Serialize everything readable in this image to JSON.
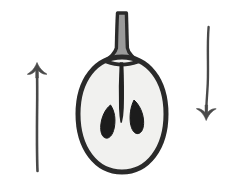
{
  "figure": {
    "background_color": "#ffffff",
    "width": 235,
    "height": 195,
    "style": "hand-drawn ink illustration",
    "alt_text": "A halved apple-like fruit shown in cross-section between an upward arrow on the left and a downward arrow on the right."
  },
  "palette": {
    "ink": "#2b2b2b",
    "ink_soft": "#4a4a4a",
    "flesh": "#f1f1ef",
    "stem_fill": "#9a9a9a",
    "seed": "#1c1c1c",
    "core": "#232323",
    "background": "#ffffff"
  },
  "elements": {
    "left_arrow": {
      "name": "up-arrow",
      "direction": "up",
      "label": "",
      "color": "#4a4a4a",
      "tail_x": 37,
      "tail_y": 172,
      "head_x": 37,
      "head_y": 63
    },
    "right_arrow": {
      "name": "down-arrow",
      "direction": "down",
      "label": "",
      "color": "#4a4a4a",
      "tail_x": 208,
      "tail_y": 26,
      "head_x": 206,
      "head_y": 120
    },
    "fruit": {
      "name": "fruit-cross-section",
      "kind": "apple",
      "center_x": 122,
      "center_y": 115,
      "radius_x": 44,
      "radius_y": 58,
      "outline_color": "#2b2b2b",
      "flesh_color": "#f1f1ef",
      "outline_width": 5
    },
    "stem": {
      "name": "fruit-stem",
      "top_x": 122,
      "top_y": 12,
      "base_y": 62,
      "fill": "#9a9a9a",
      "outline": "#2b2b2b"
    },
    "core": {
      "name": "fruit-core",
      "top_y": 62,
      "bottom_y": 122,
      "color": "#232323"
    },
    "seeds": [
      {
        "name": "seed-left",
        "cx": 108,
        "cy": 126,
        "color": "#1c1c1c"
      },
      {
        "name": "seed-right",
        "cx": 137,
        "cy": 122,
        "color": "#1c1c1c"
      }
    ]
  }
}
